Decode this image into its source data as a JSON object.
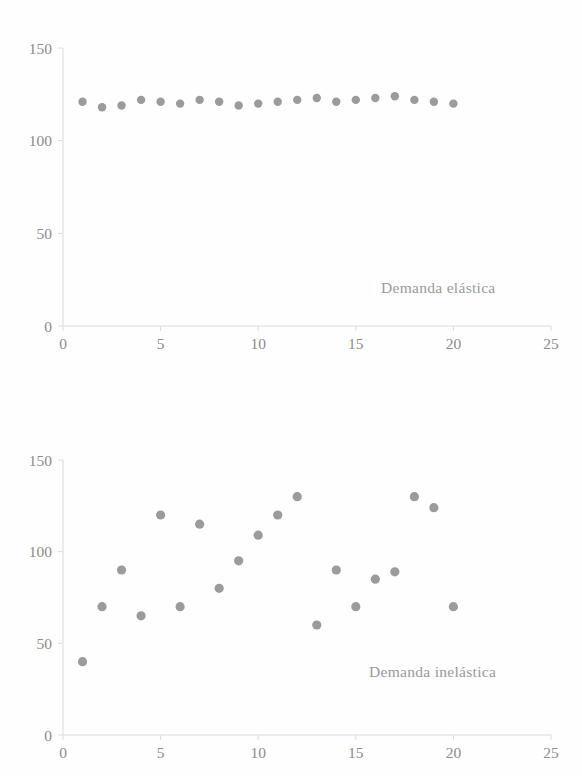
{
  "page": {
    "background_color": "#fefefe",
    "marker_color": "#9b9b9b",
    "axis_color": "#d9d9d9",
    "label_color": "#8c8c8c"
  },
  "chart_data": [
    {
      "type": "scatter",
      "title": "",
      "annotation": "Demanda elástica",
      "xlabel": "",
      "ylabel": "",
      "xlim": [
        0,
        25
      ],
      "ylim": [
        0,
        150
      ],
      "xticks": [
        "0",
        "5",
        "10",
        "15",
        "20",
        "25"
      ],
      "xtick_values": [
        0,
        5,
        10,
        15,
        20,
        25
      ],
      "yticks": [
        "0",
        "50",
        "100",
        "150"
      ],
      "ytick_values": [
        0,
        50,
        100,
        150
      ],
      "grid": false,
      "legend": "none",
      "x": [
        1,
        2,
        3,
        4,
        5,
        6,
        7,
        8,
        9,
        10,
        11,
        12,
        13,
        14,
        15,
        16,
        17,
        18,
        19,
        20
      ],
      "values": [
        121,
        118,
        119,
        122,
        121,
        120,
        122,
        121,
        119,
        120,
        121,
        122,
        123,
        121,
        122,
        123,
        124,
        122,
        121,
        120
      ]
    },
    {
      "type": "scatter",
      "title": "",
      "annotation": "Demanda inelástica",
      "xlabel": "",
      "ylabel": "",
      "xlim": [
        0,
        25
      ],
      "ylim": [
        0,
        150
      ],
      "xticks": [
        "0",
        "5",
        "10",
        "15",
        "20",
        "25"
      ],
      "xtick_values": [
        0,
        5,
        10,
        15,
        20,
        25
      ],
      "yticks": [
        "0",
        "50",
        "100",
        "150"
      ],
      "ytick_values": [
        0,
        50,
        100,
        150
      ],
      "grid": false,
      "legend": "none",
      "x": [
        1,
        2,
        3,
        4,
        5,
        6,
        7,
        8,
        9,
        10,
        11,
        12,
        13,
        14,
        15,
        16,
        17,
        18,
        19,
        20
      ],
      "values": [
        40,
        70,
        90,
        65,
        120,
        70,
        115,
        80,
        95,
        109,
        120,
        130,
        60,
        90,
        70,
        85,
        89,
        130,
        124,
        70
      ]
    }
  ]
}
